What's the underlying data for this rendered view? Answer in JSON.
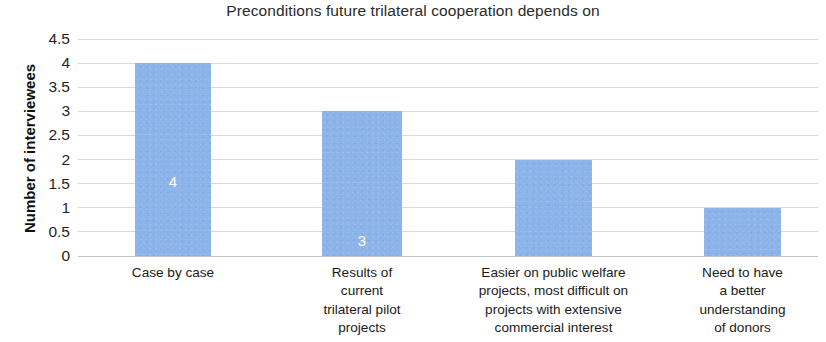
{
  "chart_data": {
    "type": "bar",
    "title": "Preconditions future trilateral cooperation depends on",
    "xlabel": "",
    "ylabel": "Number of interviewees",
    "categories": [
      "Case by case",
      "Results of current trilateral pilot projects",
      "Easier on public welfare projects, most difficult on projects with extensive commercial interest",
      "Need to have a better understanding of donors"
    ],
    "category_lines": [
      [
        "Case by case"
      ],
      [
        "Results of",
        "current",
        "trilateral pilot",
        "projects"
      ],
      [
        "Easier on public welfare",
        "projects, most difficult on",
        "projects with extensive",
        "commercial interest"
      ],
      [
        "Need to have",
        "a better",
        "understanding",
        "of donors"
      ]
    ],
    "values": [
      4,
      3,
      2,
      1
    ],
    "data_labels": [
      "4",
      "3",
      "2",
      "1"
    ],
    "ylim": [
      0,
      4.5
    ],
    "yticks": [
      0,
      0.5,
      1,
      1.5,
      2,
      2.5,
      3,
      3.5,
      4,
      4.5
    ],
    "ytick_labels": [
      "0",
      "0.5",
      "1",
      "1.5",
      "2",
      "2.5",
      "3",
      "3.5",
      "4",
      "4.5"
    ],
    "grid": true,
    "legend": false,
    "bar_color": "#8cb4ea",
    "gridline_color": "#d2d2d2",
    "data_label_color": "#ffffff",
    "background_color": "#ffffff"
  }
}
